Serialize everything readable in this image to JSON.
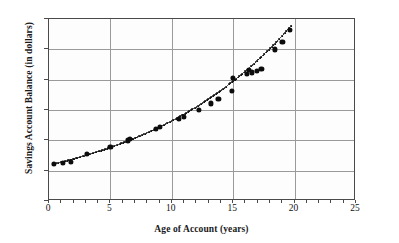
{
  "chart_data": {
    "type": "scatter",
    "title": "",
    "xlabel": "Age of Account (years)",
    "ylabel": "Savings Account Balance (in dollars)",
    "xlim": [
      0,
      25
    ],
    "ylim": [
      0,
      600
    ],
    "xticks": [
      "0",
      "5",
      "10",
      "15",
      "20",
      "25"
    ],
    "xtick_values": [
      0,
      5,
      10,
      15,
      20,
      25
    ],
    "yticks": [
      "0",
      "100",
      "200",
      "300",
      "400",
      "500",
      "600"
    ],
    "ytick_values": [
      0,
      100,
      200,
      300,
      400,
      500,
      600
    ],
    "x_minor_tick_step": 1,
    "grid": "horizontal-and-vertical-at-major-ticks",
    "legend": "none",
    "marker": "filled-circle",
    "marker_color": "#0c0c0c",
    "trendline": {
      "style": "dotted",
      "color": "#111111",
      "x_start": 0.5,
      "x_end": 19.8,
      "description": "exponential growth curve through the data points"
    },
    "points": [
      {
        "x": 0.4,
        "y": 122
      },
      {
        "x": 1.1,
        "y": 126
      },
      {
        "x": 1.8,
        "y": 130
      },
      {
        "x": 3.1,
        "y": 156
      },
      {
        "x": 5.0,
        "y": 177
      },
      {
        "x": 6.4,
        "y": 200
      },
      {
        "x": 6.6,
        "y": 206
      },
      {
        "x": 8.7,
        "y": 238
      },
      {
        "x": 9.0,
        "y": 245
      },
      {
        "x": 10.6,
        "y": 271
      },
      {
        "x": 11.0,
        "y": 277
      },
      {
        "x": 12.2,
        "y": 300
      },
      {
        "x": 13.2,
        "y": 322
      },
      {
        "x": 13.8,
        "y": 337
      },
      {
        "x": 14.9,
        "y": 362
      },
      {
        "x": 15.0,
        "y": 405
      },
      {
        "x": 16.1,
        "y": 420
      },
      {
        "x": 16.3,
        "y": 432
      },
      {
        "x": 16.5,
        "y": 424
      },
      {
        "x": 16.9,
        "y": 428
      },
      {
        "x": 17.3,
        "y": 436
      },
      {
        "x": 18.4,
        "y": 500
      },
      {
        "x": 19.0,
        "y": 525
      },
      {
        "x": 19.6,
        "y": 565
      }
    ]
  }
}
